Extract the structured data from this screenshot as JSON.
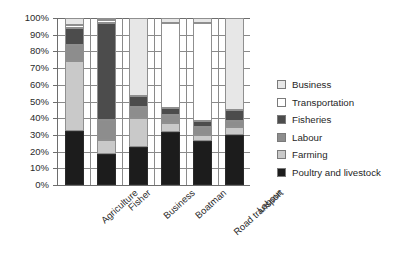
{
  "chart_data": {
    "type": "bar",
    "subtype": "stacked-percentage-column",
    "title": "",
    "xlabel": "",
    "ylabel": "",
    "ylim": [
      0,
      100
    ],
    "yunit": "%",
    "grid": true,
    "legend_position": "right",
    "categories": [
      "Agriculture",
      "Fisher",
      "Business",
      "Boatman",
      "Road transport",
      "Labour"
    ],
    "tick_labels": [
      "0%",
      "10%",
      "20%",
      "30%",
      "40%",
      "50%",
      "60%",
      "70%",
      "80%",
      "90%",
      "100%"
    ],
    "tick_values": [
      0,
      10,
      20,
      30,
      40,
      50,
      60,
      70,
      80,
      90,
      100
    ],
    "legend_order": [
      "Business",
      "Transportation",
      "Fisheries",
      "Labour",
      "Farming",
      "Poultry and livestock"
    ],
    "stack_order_bottom_to_top": [
      "Poultry and livestock",
      "Farming",
      "Labour",
      "Fisheries",
      "Transportation",
      "Business"
    ],
    "series": [
      {
        "name": "Poultry and livestock",
        "color": "#1c1c1c",
        "values": [
          32.5,
          18.5,
          23.0,
          32.0,
          26.5,
          30.0
        ]
      },
      {
        "name": "Farming",
        "color": "#c9c9c9",
        "values": [
          41.5,
          8.5,
          17.0,
          5.0,
          3.5,
          4.5
        ]
      },
      {
        "name": "Labour",
        "color": "#8d8d8d",
        "values": [
          10.0,
          12.0,
          7.0,
          5.0,
          4.5,
          4.0
        ]
      },
      {
        "name": "Fisheries",
        "color": "#4c4c4c",
        "values": [
          10.0,
          58.0,
          6.0,
          4.0,
          4.0,
          6.5
        ]
      },
      {
        "name": "Transportation",
        "color": "#ffffff",
        "values": [
          2.0,
          2.0,
          0.0,
          51.0,
          58.5,
          0.0
        ]
      },
      {
        "name": "Business",
        "color": "#e7e7e7",
        "values": [
          4.0,
          1.0,
          47.0,
          3.0,
          3.0,
          55.0
        ]
      }
    ]
  },
  "legend": {
    "items": [
      {
        "label": "Business",
        "color": "#e7e7e7"
      },
      {
        "label": "Transportation",
        "color": "#ffffff"
      },
      {
        "label": "Fisheries",
        "color": "#4c4c4c"
      },
      {
        "label": "Labour",
        "color": "#8d8d8d"
      },
      {
        "label": "Farming",
        "color": "#c9c9c9"
      },
      {
        "label": "Poultry and livestock",
        "color": "#1c1c1c"
      }
    ]
  }
}
